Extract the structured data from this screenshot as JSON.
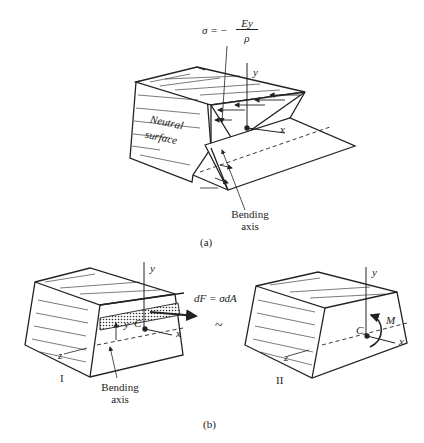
{
  "figure_a": {
    "formula_lhs": "σ = −",
    "formula_num": "Ey",
    "formula_den": "ρ",
    "axis_y": "y",
    "axis_x": "x",
    "neutral_surface_line1": "Neutral",
    "neutral_surface_line2": "surface",
    "bending_axis_line1": "Bending",
    "bending_axis_line2": "axis",
    "caption": "(a)"
  },
  "figure_b": {
    "part1": {
      "label": "I",
      "axis_y": "y",
      "axis_x": "x",
      "axis_z": "z",
      "centroid": "C",
      "distance_y": "y",
      "force_label": "dF = σdA",
      "bending_axis_line1": "Bending",
      "bending_axis_line2": "axis"
    },
    "equivalence": "~",
    "part2": {
      "label": "II",
      "axis_y": "y",
      "axis_x": "x",
      "axis_z": "z",
      "centroid": "C",
      "moment": "M"
    },
    "caption": "(b)"
  }
}
